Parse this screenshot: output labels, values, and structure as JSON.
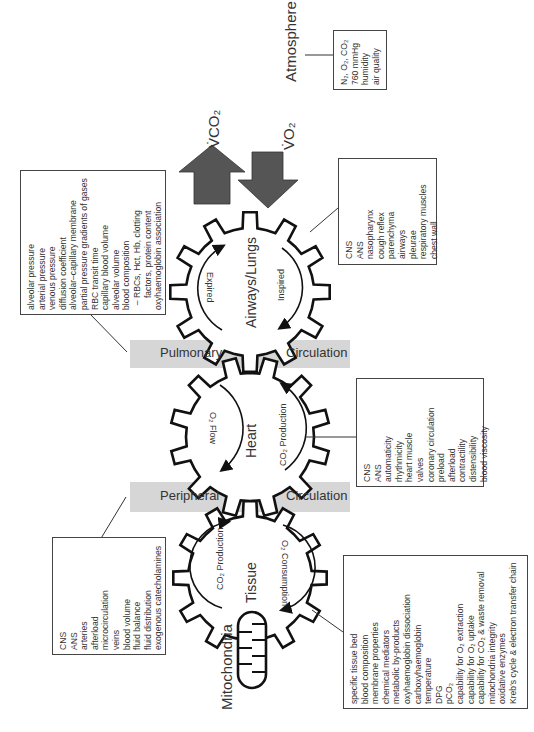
{
  "atmosphere": {
    "label": "Atmosphere",
    "items": [
      "N₂, O₂, CO₂",
      "760 mmHg",
      "humidity",
      "air quality"
    ]
  },
  "flows": {
    "vco2_label": "V̇CO₂",
    "vo2_label": "V̇O₂",
    "up_arrow_color": "#555555",
    "down_arrow_color": "#555555"
  },
  "gears": {
    "lungs": {
      "label": "Airways/Lungs",
      "left_arrow": "Expired",
      "right_arrow": "Inspired"
    },
    "heart": {
      "label": "Heart",
      "left_arrow": "O₂ Flow",
      "right_arrow": "CO₂ Production"
    },
    "tissue": {
      "label": "Tissue",
      "left_arrow": "CO₂ Production",
      "right_arrow": "O₂ Consumption"
    }
  },
  "mitochondria": {
    "label": "Mitochondria"
  },
  "bands": {
    "pulmonary": {
      "left": "Pulmonary",
      "right": "Circulation",
      "color": "#d6d6d6"
    },
    "peripheral": {
      "left": "Peripheral",
      "right": "Circulation",
      "color": "#d6d6d6"
    }
  },
  "boxes": {
    "lung_gas": {
      "items": [
        "alveolar pressure",
        "arterial pressure",
        "venous pressure",
        "diffusion coefficient",
        "alveolar–capillary membrane",
        "partial pressure gradients of gases",
        "RBC transit time",
        "capillary blood volume",
        "alveolar volume",
        "blood composition",
        "  – RBCs, Hct, Hb, clotting",
        "     factors, protein content",
        "oxyhaemoglobin association"
      ]
    },
    "airway": {
      "items": [
        "CNS",
        "ANS",
        "nasopharynx",
        "cough reflex",
        "parenchyma",
        "airways",
        "pleurae",
        "respiratory muscles",
        "chest wall"
      ]
    },
    "heart": {
      "items": [
        "CNS",
        "ANS",
        "automaticity",
        "rhythmicity",
        "heart muscle",
        "valves",
        "coronary circulation",
        "preload",
        "afterload",
        "contractility",
        "distensibility",
        "blood viscosity"
      ]
    },
    "peripheral": {
      "items": [
        "CNS",
        "ANS",
        "arteries",
        "afterload",
        "microcirculation",
        "veins",
        "blood volume",
        "fluid balance",
        "fluid distribution",
        "exogenous catecholamines"
      ]
    },
    "tissue": {
      "items": [
        "specific tissue bed",
        "blood composition",
        "membrane properties",
        "chemical mediators",
        "metabolic by-products",
        "oxyhaemoglobin dissociation",
        "carboxyhaemoglobin",
        "temperature",
        "DPG",
        "pCO₂",
        "capability for O₂ extraction",
        "capability for O₂ uptake",
        "capability for CO₂ & waste removal",
        "mitochondria integrity",
        "oxidative enzymes",
        "Kreb's cycle & electron transfer chain"
      ]
    }
  }
}
